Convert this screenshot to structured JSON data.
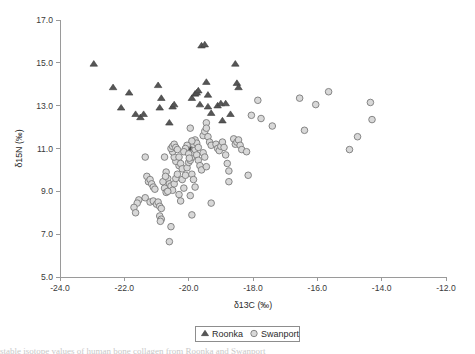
{
  "figure": {
    "background_color": "#ffffff",
    "axis_color": "#9a9a9a",
    "text_color": "#2b2b2b"
  },
  "axes": {
    "x_title": "δ13C (‰)",
    "y_title": "δ15N (‰)",
    "x_ticks": [
      "-24.0",
      "-22.0",
      "-20.0",
      "-18.0",
      "-16.0",
      "-14.0",
      "-12.0"
    ],
    "y_ticks": [
      "5.0",
      "7.0",
      "9.0",
      "11.0",
      "13.0",
      "15.0",
      "17.0"
    ]
  },
  "legend": {
    "items": [
      {
        "label": "Roonka",
        "marker": "triangle",
        "color": "#565656"
      },
      {
        "label": "Swanport",
        "marker": "circle",
        "color": "#d8d8d8"
      }
    ]
  },
  "caption": {
    "text": "stable isotope values of human bone collagen from Roonka and Swanport"
  },
  "chart_data": {
    "type": "scatter",
    "title": "",
    "xlabel": "δ13C (‰)",
    "ylabel": "δ15N (‰)",
    "xlim": [
      -24.0,
      -12.0
    ],
    "ylim": [
      5.0,
      17.0
    ],
    "xticks": [
      -24.0,
      -22.0,
      -20.0,
      -18.0,
      -16.0,
      -14.0,
      -12.0
    ],
    "yticks": [
      5.0,
      7.0,
      9.0,
      11.0,
      13.0,
      15.0,
      17.0
    ],
    "grid": false,
    "legend_position": "bottom-center-outside",
    "series": [
      {
        "name": "Roonka",
        "marker": "triangle",
        "color": "#565656",
        "edge_color": "#3d3d3d",
        "points": [
          [
            -22.95,
            14.95
          ],
          [
            -22.35,
            13.85
          ],
          [
            -22.1,
            12.9
          ],
          [
            -21.85,
            13.6
          ],
          [
            -21.65,
            12.6
          ],
          [
            -21.5,
            12.45
          ],
          [
            -21.4,
            12.6
          ],
          [
            -20.95,
            13.95
          ],
          [
            -20.9,
            12.9
          ],
          [
            -20.85,
            13.35
          ],
          [
            -20.6,
            12.2
          ],
          [
            -20.5,
            12.95
          ],
          [
            -20.45,
            13.05
          ],
          [
            -19.9,
            13.35
          ],
          [
            -19.8,
            13.55
          ],
          [
            -19.75,
            13.6
          ],
          [
            -19.7,
            13.7
          ],
          [
            -19.65,
            13.05
          ],
          [
            -19.6,
            15.8
          ],
          [
            -19.5,
            15.85
          ],
          [
            -19.45,
            14.1
          ],
          [
            -19.4,
            13.5
          ],
          [
            -19.4,
            12.95
          ],
          [
            -19.3,
            12.65
          ],
          [
            -19.1,
            13.0
          ],
          [
            -19.0,
            13.1
          ],
          [
            -18.95,
            12.3
          ],
          [
            -18.85,
            13.1
          ],
          [
            -18.7,
            12.6
          ],
          [
            -18.55,
            14.95
          ],
          [
            -18.5,
            14.05
          ],
          [
            -18.45,
            13.85
          ],
          [
            -19.95,
            11.15
          ],
          [
            -20.0,
            11.0
          ],
          [
            -19.95,
            10.9
          ]
        ]
      },
      {
        "name": "Swanport",
        "marker": "circle",
        "color": "#d8d8d8",
        "edge_color": "#7a7a7a",
        "points": [
          [
            -21.35,
            10.6
          ],
          [
            -21.3,
            9.7
          ],
          [
            -21.25,
            9.45
          ],
          [
            -21.2,
            9.55
          ],
          [
            -21.15,
            9.35
          ],
          [
            -21.1,
            9.2
          ],
          [
            -21.05,
            9.1
          ],
          [
            -21.55,
            8.6
          ],
          [
            -21.6,
            8.45
          ],
          [
            -21.7,
            8.25
          ],
          [
            -21.65,
            8.0
          ],
          [
            -21.35,
            8.7
          ],
          [
            -21.2,
            8.5
          ],
          [
            -21.1,
            8.55
          ],
          [
            -21.0,
            8.4
          ],
          [
            -20.95,
            8.5
          ],
          [
            -20.9,
            8.3
          ],
          [
            -20.85,
            8.2
          ],
          [
            -20.9,
            7.85
          ],
          [
            -20.85,
            7.7
          ],
          [
            -20.88,
            7.6
          ],
          [
            -20.55,
            7.35
          ],
          [
            -20.6,
            6.65
          ],
          [
            -20.75,
            10.6
          ],
          [
            -20.7,
            9.9
          ],
          [
            -20.65,
            9.6
          ],
          [
            -20.6,
            9.35
          ],
          [
            -20.55,
            9.25
          ],
          [
            -20.5,
            9.05
          ],
          [
            -20.45,
            9.35
          ],
          [
            -20.4,
            9.6
          ],
          [
            -20.35,
            9.8
          ],
          [
            -20.3,
            10.2
          ],
          [
            -20.4,
            10.4
          ],
          [
            -20.45,
            10.6
          ],
          [
            -20.5,
            10.85
          ],
          [
            -20.55,
            11.0
          ],
          [
            -20.5,
            11.1
          ],
          [
            -20.45,
            11.2
          ],
          [
            -20.4,
            11.05
          ],
          [
            -20.35,
            10.95
          ],
          [
            -20.3,
            10.6
          ],
          [
            -20.25,
            10.3
          ],
          [
            -20.2,
            10.05
          ],
          [
            -20.2,
            9.55
          ],
          [
            -20.15,
            9.15
          ],
          [
            -20.3,
            8.85
          ],
          [
            -20.25,
            8.55
          ],
          [
            -20.1,
            9.75
          ],
          [
            -20.05,
            10.1
          ],
          [
            -20.0,
            10.35
          ],
          [
            -19.95,
            10.45
          ],
          [
            -19.9,
            10.6
          ],
          [
            -19.85,
            10.8
          ],
          [
            -19.8,
            10.95
          ],
          [
            -19.85,
            11.2
          ],
          [
            -19.8,
            11.4
          ],
          [
            -19.75,
            11.25
          ],
          [
            -19.7,
            11.05
          ],
          [
            -19.95,
            11.95
          ],
          [
            -19.9,
            11.35
          ],
          [
            -19.75,
            10.7
          ],
          [
            -19.7,
            10.45
          ],
          [
            -19.65,
            10.2
          ],
          [
            -19.6,
            10.0
          ],
          [
            -19.9,
            9.8
          ],
          [
            -19.85,
            9.55
          ],
          [
            -19.8,
            9.2
          ],
          [
            -19.95,
            8.8
          ],
          [
            -19.9,
            7.9
          ],
          [
            -19.55,
            11.6
          ],
          [
            -19.5,
            11.8
          ],
          [
            -19.45,
            12.2
          ],
          [
            -19.45,
            11.95
          ],
          [
            -19.4,
            11.55
          ],
          [
            -19.35,
            11.3
          ],
          [
            -19.3,
            11.15
          ],
          [
            -19.55,
            10.8
          ],
          [
            -19.5,
            10.6
          ],
          [
            -19.45,
            10.15
          ],
          [
            -19.3,
            8.45
          ],
          [
            -19.15,
            11.2
          ],
          [
            -19.1,
            11.0
          ],
          [
            -19.05,
            10.9
          ],
          [
            -19.0,
            11.1
          ],
          [
            -18.95,
            11.3
          ],
          [
            -18.9,
            11.05
          ],
          [
            -18.85,
            10.7
          ],
          [
            -18.8,
            10.3
          ],
          [
            -18.75,
            9.95
          ],
          [
            -18.75,
            9.45
          ],
          [
            -18.6,
            11.45
          ],
          [
            -18.55,
            11.2
          ],
          [
            -18.5,
            11.3
          ],
          [
            -18.45,
            11.4
          ],
          [
            -18.4,
            11.15
          ],
          [
            -18.35,
            10.95
          ],
          [
            -18.2,
            10.85
          ],
          [
            -18.15,
            9.75
          ],
          [
            -18.05,
            12.55
          ],
          [
            -17.85,
            13.25
          ],
          [
            -17.75,
            12.4
          ],
          [
            -17.4,
            12.05
          ],
          [
            -16.55,
            13.35
          ],
          [
            -16.4,
            11.85
          ],
          [
            -16.05,
            13.05
          ],
          [
            -15.65,
            13.65
          ],
          [
            -15.0,
            10.95
          ],
          [
            -14.75,
            11.55
          ],
          [
            -14.35,
            13.15
          ],
          [
            -14.3,
            12.35
          ],
          [
            -20.75,
            9.15
          ],
          [
            -20.7,
            8.95
          ],
          [
            -20.65,
            9.0
          ],
          [
            -20.8,
            9.45
          ],
          [
            -20.72,
            9.7
          ],
          [
            -20.05,
            11.15
          ],
          [
            -20.1,
            11.0
          ],
          [
            -20.15,
            10.85
          ],
          [
            -20.0,
            10.75
          ],
          [
            -19.98,
            10.55
          ]
        ]
      }
    ]
  }
}
